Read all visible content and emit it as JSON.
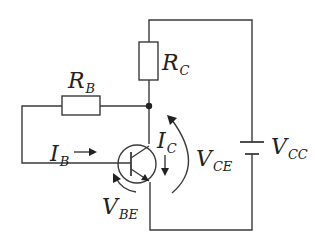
{
  "diagram": {
    "components": {
      "rb": {
        "symbol": "R",
        "sub": "B",
        "type": "resistor"
      },
      "rc": {
        "symbol": "R",
        "sub": "C",
        "type": "resistor"
      },
      "vcc": {
        "symbol": "V",
        "sub": "CC",
        "type": "battery"
      },
      "transistor": {
        "type": "npn-bjt"
      }
    },
    "labels": {
      "ib": {
        "symbol": "I",
        "sub": "B"
      },
      "ic": {
        "symbol": "I",
        "sub": "C"
      },
      "vce": {
        "symbol": "V",
        "sub": "CE"
      },
      "vbe": {
        "symbol": "V",
        "sub": "BE"
      }
    },
    "colors": {
      "line": "#3a3a3a",
      "text": "#222222",
      "background": "#ffffff"
    }
  }
}
